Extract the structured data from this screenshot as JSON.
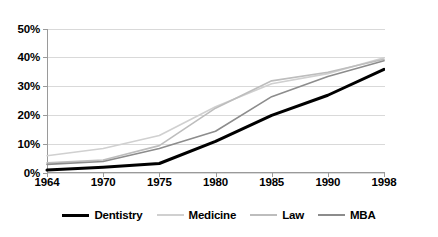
{
  "chart_data": {
    "type": "line",
    "title": "",
    "subtitle": "",
    "xlabel": "",
    "ylabel": "",
    "x": [
      "1964",
      "1970",
      "1975",
      "1980",
      "1985",
      "1990",
      "1998"
    ],
    "categories": [
      "1964",
      "1970",
      "1975",
      "1980",
      "1985",
      "1990",
      "1998"
    ],
    "ytick_labels": [
      "0%",
      "10%",
      "20%",
      "30%",
      "40%",
      "50%"
    ],
    "ytick_values": [
      0,
      10,
      20,
      30,
      40,
      50
    ],
    "ylim": [
      0,
      50
    ],
    "grid": "horizontal",
    "legend_position": "bottom",
    "series": [
      {
        "name": "Dentistry",
        "color": "#000000",
        "width": 3.0,
        "values": [
          1,
          2,
          3.3,
          11,
          20,
          27,
          36
        ]
      },
      {
        "name": "Medicine",
        "color": "#d0d0d0",
        "width": 1.6,
        "values": [
          6,
          8.5,
          13,
          23,
          31,
          34.5,
          40
        ]
      },
      {
        "name": "Law",
        "color": "#bdbdbd",
        "width": 1.6,
        "values": [
          3.5,
          4.5,
          9.5,
          22.5,
          32,
          35,
          39.5
        ]
      },
      {
        "name": "MBA",
        "color": "#8c8c8c",
        "width": 1.6,
        "values": [
          3,
          4,
          8.5,
          14.5,
          26.5,
          33.5,
          39
        ]
      }
    ]
  },
  "axes": {
    "axis_line_color": "#9a9a9a",
    "grid_color": "#d9d9d9"
  },
  "legend": {
    "items": [
      {
        "label": "Dentistry",
        "series": "Dentistry"
      },
      {
        "label": "Medicine",
        "series": "Medicine"
      },
      {
        "label": "Law",
        "series": "Law"
      },
      {
        "label": "MBA",
        "series": "MBA"
      }
    ]
  }
}
